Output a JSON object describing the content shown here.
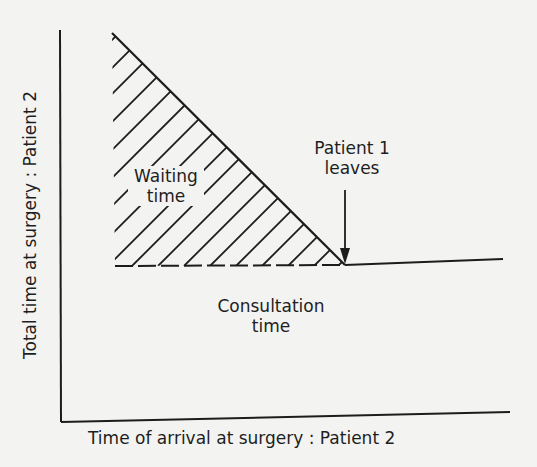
{
  "diagram": {
    "type": "schematic_graph",
    "x_axis": {
      "label": "Time of arrival at surgery : Patient 2"
    },
    "y_axis": {
      "label": "Total time at surgery : Patient 2"
    },
    "regions": [
      {
        "name": "waiting-time",
        "label_lines": [
          "Waiting",
          "time"
        ],
        "shape": "hatched right triangle",
        "description": "Waiting time decreases linearly as Patient 2 arrives later"
      },
      {
        "name": "consultation-time",
        "label_lines": [
          "Consultation",
          "time"
        ],
        "shape": "constant band below dashed line"
      }
    ],
    "annotations": [
      {
        "name": "patient-1-leaves",
        "label_lines": [
          "Patient 1",
          "leaves"
        ],
        "marker": "down arrow pointing to kink in curve"
      }
    ],
    "colors": {
      "ink": "#1c1c1c",
      "paper": "#f3f3f1"
    }
  }
}
